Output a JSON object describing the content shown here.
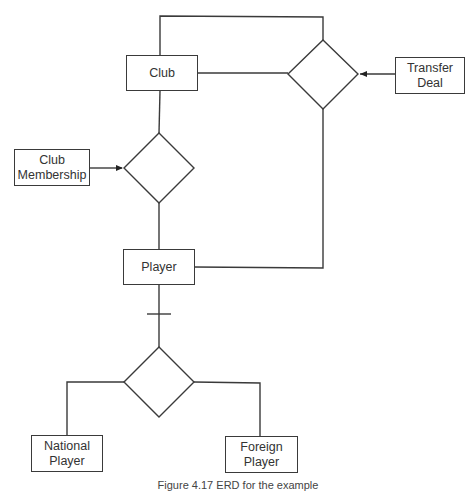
{
  "diagram": {
    "type": "ER diagram",
    "entities": {
      "club": {
        "label": "Club"
      },
      "transfer_deal": {
        "label": "Transfer\nDeal"
      },
      "club_membership": {
        "label": "Club\nMembership"
      },
      "player": {
        "label": "Player"
      },
      "national_player": {
        "label": "National\nPlayer"
      },
      "foreign_player": {
        "label": "Foreign\nPlayer"
      }
    },
    "relationships": [
      {
        "name": "transfer-relationship",
        "connects": [
          "Club",
          "Player",
          "Transfer Deal"
        ]
      },
      {
        "name": "membership-relationship",
        "connects": [
          "Club",
          "Player",
          "Club Membership"
        ]
      },
      {
        "name": "player-subtype",
        "connects": [
          "Player",
          "National Player",
          "Foreign Player"
        ]
      }
    ],
    "colors": {
      "line": "#3a3a3a",
      "text": "#333333",
      "background": "#ffffff"
    }
  },
  "caption": "Figure 4.17 ERD for the example"
}
